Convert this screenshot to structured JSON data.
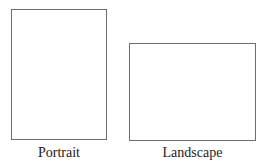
{
  "diagram": {
    "shapes": [
      {
        "id": "portrait",
        "label": "Portrait",
        "orientation": "vertical",
        "border_color": "#6e6e6e",
        "fill_color": "#ffffff"
      },
      {
        "id": "landscape",
        "label": "Landscape",
        "orientation": "horizontal",
        "border_color": "#6e6e6e",
        "fill_color": "#ffffff"
      }
    ]
  }
}
